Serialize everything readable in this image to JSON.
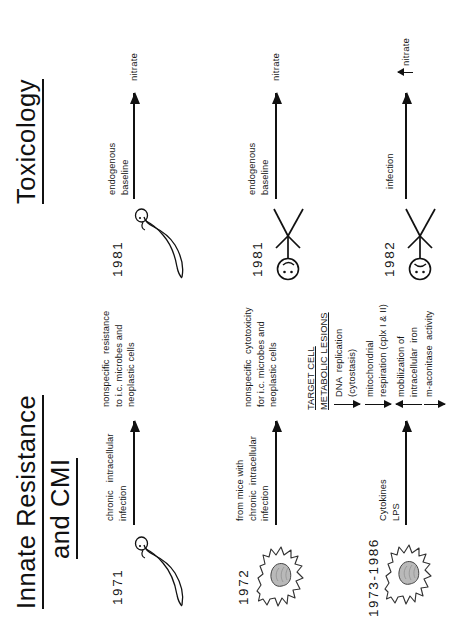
{
  "slide": {
    "title_left_line1": "Innate  Resistance",
    "title_left_line2": "and CMI",
    "title_right": "Toxicology"
  },
  "rows": [
    {
      "year": "1971",
      "figure": "mouse-icon",
      "cause": "chronic   intracellular\ninfection",
      "effect": "nonspecific  resistance\nto i.c. microbes and\nneoplastic cells",
      "right_year": "1981",
      "right_figure": "mouse-icon",
      "right_cause": "endogenous\nbaseline",
      "right_effect": "nitrate"
    },
    {
      "year": "1972",
      "figure": "macrophage-icon",
      "cause": "from mice with\nchronic  intracellular\ninfection",
      "effect": "nonspecific  cytotoxicity\nfor i.c. microbes and\nneoplastic cells",
      "right_year": "1981",
      "right_figure": "happy-stick-figure-icon",
      "right_cause": "endogenous\nbaseline",
      "right_effect": "nitrate"
    },
    {
      "year": "1973-1986",
      "figure": "macrophage-icon",
      "cause": "Cytokines\nLPS",
      "effect_heading_line1": "TARGET CELL",
      "effect_heading_line2": "METABOLIC LESIONS",
      "right_year": "1982",
      "right_figure": "sad-stick-figure-icon",
      "right_cause": "infection",
      "right_effect": "nitrate"
    }
  ],
  "lesions": [
    {
      "direction": "down",
      "text": "DNA  replication\n(cytostasis)"
    },
    {
      "direction": "down",
      "text": "mitochondrial\nrespiration (cplx I & II)"
    },
    {
      "direction": "up",
      "text": "mobilization of\nintracellular  iron"
    },
    {
      "direction": "down",
      "text": "m-aconitase  activity"
    }
  ],
  "colors": {
    "ink": "#111111",
    "paper": "#ffffff",
    "nucleus_fill": "#b9b9b9"
  }
}
